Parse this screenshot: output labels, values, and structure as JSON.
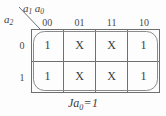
{
  "figure": {
    "type": "karnaugh-map",
    "caption_variable": "Ja",
    "caption_subscript": "0",
    "caption_operator": "=",
    "caption_value": "1",
    "caption_full": "Ja0 = 1"
  },
  "axes": {
    "column_variables": {
      "first": "a",
      "first_sub": "1",
      "second": "a",
      "second_sub": "0"
    },
    "row_variable": {
      "name": "a",
      "sub": "2"
    },
    "column_headers": [
      "00",
      "01",
      "11",
      "10"
    ],
    "row_headers": [
      "0",
      "1"
    ]
  },
  "grid": {
    "rows": [
      {
        "label": "0",
        "cells": [
          "1",
          "X",
          "X",
          "1"
        ]
      },
      {
        "label": "1",
        "cells": [
          "1",
          "X",
          "X",
          "1"
        ]
      }
    ]
  },
  "groups": [
    {
      "name": "full-map-group",
      "covers": "all-eight-cells",
      "shape": "rounded-rectangle"
    }
  ],
  "colors": {
    "background": "#fdfdfd",
    "grid_line": "#6f6f6f",
    "text": "#3b3b3b",
    "group_loop": "#8a8a8a"
  }
}
